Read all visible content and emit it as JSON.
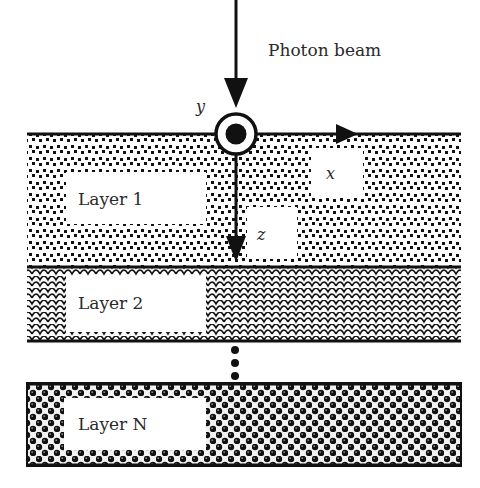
{
  "diagram": {
    "beam": {
      "label": "Photon beam",
      "direction": "downward"
    },
    "axes": {
      "x": {
        "label": "x",
        "direction": "right"
      },
      "y": {
        "label": "y",
        "direction": "out-of-page"
      },
      "z": {
        "label": "z",
        "direction": "down"
      }
    },
    "layers": [
      {
        "label": "Layer 1",
        "pattern": "dotted-squares"
      },
      {
        "label": "Layer 2",
        "pattern": "scales"
      },
      {
        "label": "Layer N",
        "pattern": "spheres"
      }
    ],
    "ellipsis": "vertical-dots",
    "colors": {
      "ink": "#111111",
      "background": "#ffffff",
      "text": "#2a2a2a"
    }
  }
}
